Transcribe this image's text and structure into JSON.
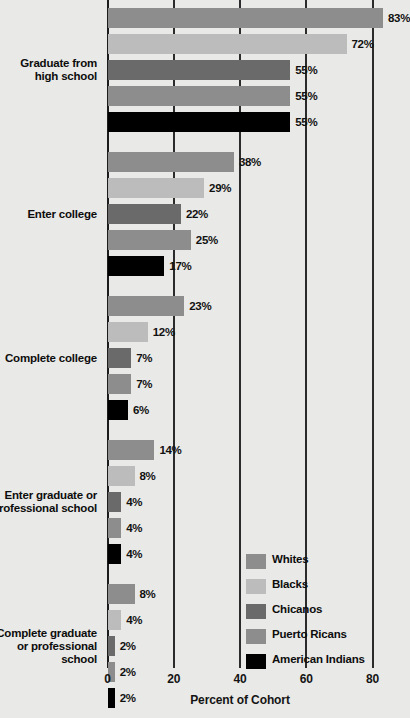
{
  "chart_data": {
    "type": "bar",
    "orientation": "horizontal",
    "title": "",
    "xlabel": "Percent of Cohort",
    "ylabel": "",
    "xlim": [
      0,
      80
    ],
    "xticks": [
      0,
      20,
      40,
      60,
      80
    ],
    "xtick_labels": [
      "0",
      "20",
      "40",
      "60",
      "80"
    ],
    "grid": true,
    "legend_position": "lower-right",
    "value_suffix": "%",
    "categories": [
      "Graduate from\nhigh school",
      "Enter college",
      "Complete college",
      "Enter graduate or\nprofessional school",
      "Complete graduate\nor professional\nschool"
    ],
    "series": [
      {
        "name": "Whites",
        "color": "#8d8d8d",
        "values": [
          83,
          38,
          23,
          14,
          8
        ]
      },
      {
        "name": "Blacks",
        "color": "#bcbcbc",
        "values": [
          72,
          29,
          12,
          8,
          4
        ]
      },
      {
        "name": "Chicanos",
        "color": "#6a6a6a",
        "values": [
          55,
          22,
          7,
          4,
          2
        ]
      },
      {
        "name": "Puerto Ricans",
        "color": "#8d8d8d",
        "values": [
          55,
          25,
          7,
          4,
          2
        ]
      },
      {
        "name": "American Indians",
        "color": "#000000",
        "values": [
          55,
          17,
          6,
          4,
          2
        ]
      }
    ],
    "groups": [
      {
        "label_line1": "Graduate from",
        "label_line2": "high school",
        "label_line3": "",
        "bars": [
          {
            "series": "Whites",
            "value": 83,
            "value_label": "83%",
            "color": "#8d8d8d"
          },
          {
            "series": "Blacks",
            "value": 72,
            "value_label": "72%",
            "color": "#bcbcbc"
          },
          {
            "series": "Chicanos",
            "value": 55,
            "value_label": "55%",
            "color": "#6a6a6a"
          },
          {
            "series": "Puerto Ricans",
            "value": 55,
            "value_label": "55%",
            "color": "#8d8d8d"
          },
          {
            "series": "American Indians",
            "value": 55,
            "value_label": "55%",
            "color": "#000000"
          }
        ]
      },
      {
        "label_line1": "Enter college",
        "label_line2": "",
        "label_line3": "",
        "bars": [
          {
            "series": "Whites",
            "value": 38,
            "value_label": "38%",
            "color": "#8d8d8d"
          },
          {
            "series": "Blacks",
            "value": 29,
            "value_label": "29%",
            "color": "#bcbcbc"
          },
          {
            "series": "Chicanos",
            "value": 22,
            "value_label": "22%",
            "color": "#6a6a6a"
          },
          {
            "series": "Puerto Ricans",
            "value": 25,
            "value_label": "25%",
            "color": "#8d8d8d"
          },
          {
            "series": "American Indians",
            "value": 17,
            "value_label": "17%",
            "color": "#000000"
          }
        ]
      },
      {
        "label_line1": "Complete college",
        "label_line2": "",
        "label_line3": "",
        "bars": [
          {
            "series": "Whites",
            "value": 23,
            "value_label": "23%",
            "color": "#8d8d8d"
          },
          {
            "series": "Blacks",
            "value": 12,
            "value_label": "12%",
            "color": "#bcbcbc"
          },
          {
            "series": "Chicanos",
            "value": 7,
            "value_label": "7%",
            "color": "#6a6a6a"
          },
          {
            "series": "Puerto Ricans",
            "value": 7,
            "value_label": "7%",
            "color": "#8d8d8d"
          },
          {
            "series": "American Indians",
            "value": 6,
            "value_label": "6%",
            "color": "#000000"
          }
        ]
      },
      {
        "label_line1": "Enter graduate or",
        "label_line2": "professional school",
        "label_line3": "",
        "bars": [
          {
            "series": "Whites",
            "value": 14,
            "value_label": "14%",
            "color": "#8d8d8d"
          },
          {
            "series": "Blacks",
            "value": 8,
            "value_label": "8%",
            "color": "#bcbcbc"
          },
          {
            "series": "Chicanos",
            "value": 4,
            "value_label": "4%",
            "color": "#6a6a6a"
          },
          {
            "series": "Puerto Ricans",
            "value": 4,
            "value_label": "4%",
            "color": "#8d8d8d"
          },
          {
            "series": "American Indians",
            "value": 4,
            "value_label": "4%",
            "color": "#000000"
          }
        ]
      },
      {
        "label_line1": "Complete graduate",
        "label_line2": "or professional",
        "label_line3": "school",
        "bars": [
          {
            "series": "Whites",
            "value": 8,
            "value_label": "8%",
            "color": "#8d8d8d"
          },
          {
            "series": "Blacks",
            "value": 4,
            "value_label": "4%",
            "color": "#bcbcbc"
          },
          {
            "series": "Chicanos",
            "value": 2,
            "value_label": "2%",
            "color": "#6a6a6a"
          },
          {
            "series": "Puerto Ricans",
            "value": 2,
            "value_label": "2%",
            "color": "#8d8d8d"
          },
          {
            "series": "American Indians",
            "value": 2,
            "value_label": "2%",
            "color": "#000000"
          }
        ]
      }
    ],
    "legend": [
      {
        "label": "Whites",
        "color": "#8d8d8d"
      },
      {
        "label": "Blacks",
        "color": "#bcbcbc"
      },
      {
        "label": "Chicanos",
        "color": "#6a6a6a"
      },
      {
        "label": "Puerto Ricans",
        "color": "#8d8d8d"
      },
      {
        "label": "American Indians",
        "color": "#000000"
      }
    ]
  }
}
